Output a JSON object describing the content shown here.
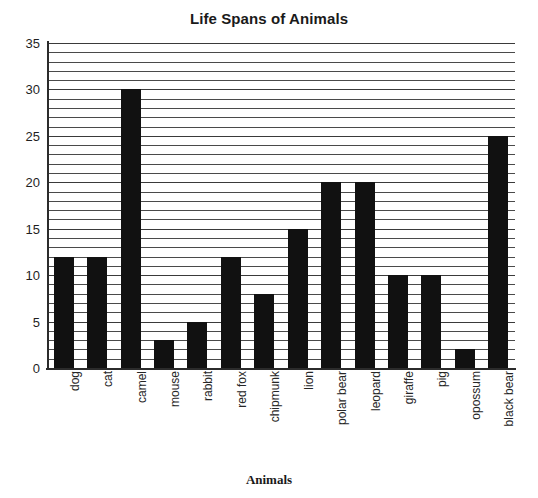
{
  "chart_data": {
    "type": "bar",
    "title": "Life Spans of Animals",
    "xlabel": "Animals",
    "ylabel": "",
    "ylim": [
      0,
      35
    ],
    "y_major_ticks": [
      0,
      5,
      10,
      15,
      20,
      25,
      30,
      35
    ],
    "y_minor_tick_step": 1,
    "grid": "horizontal-minor-and-major",
    "legend": "none",
    "bar_color": "#111111",
    "categories": [
      "dog",
      "cat",
      "camel",
      "mouse",
      "rabbit",
      "red fox",
      "chipmunk",
      "lion",
      "polar bear",
      "leopard",
      "giraffe",
      "pig",
      "opossum",
      "black bear"
    ],
    "values": [
      12,
      12,
      30,
      3,
      5,
      12,
      8,
      15,
      20,
      20,
      10,
      10,
      2,
      25
    ]
  },
  "axis": {
    "y_tick_labels": [
      "35",
      "30",
      "25",
      "20",
      "15",
      "10",
      "5",
      "0"
    ],
    "x_title": "Animals"
  }
}
